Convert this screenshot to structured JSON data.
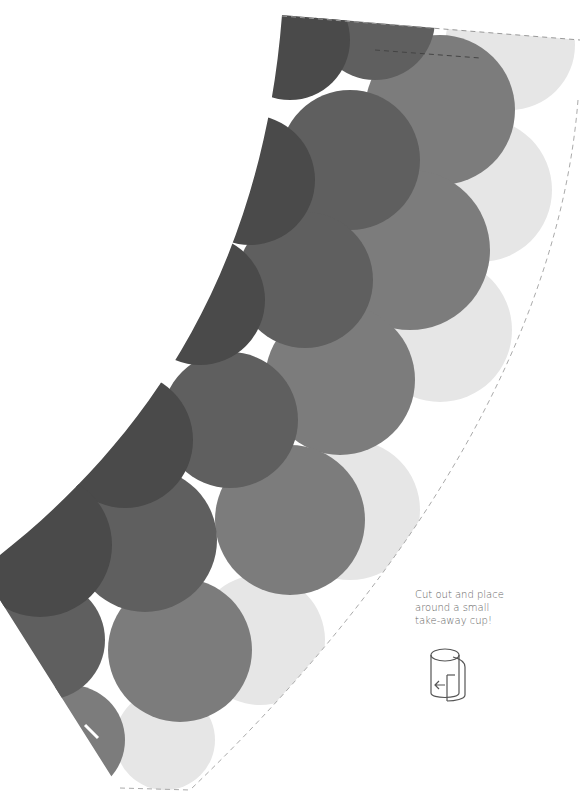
{
  "template": {
    "type": "cup-sleeve-cutout",
    "colors": {
      "darkest": "#4a4a4a",
      "dark": "#5f5f5f",
      "mid": "#7c7c7c",
      "light": "#e6e6e6",
      "cut_line": "#9a9a9a",
      "background": "#ffffff"
    }
  },
  "instructions": {
    "lines": [
      "Cut out and place",
      "around a small",
      "take-away cup!"
    ]
  },
  "icons": {
    "cup_wrap": "cup-wrap-icon"
  }
}
